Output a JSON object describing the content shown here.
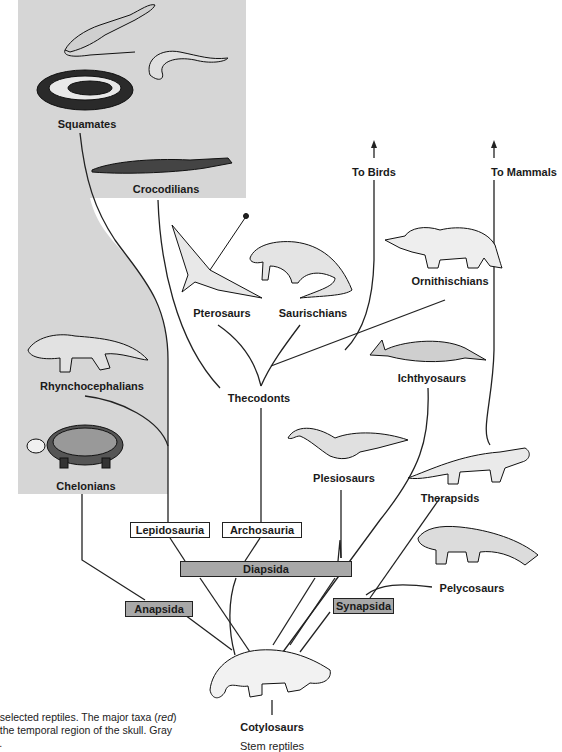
{
  "taxa": {
    "squamates": "Squamates",
    "crocodilians": "Crocodilians",
    "to_birds": "To Birds",
    "to_mammals": "To Mammals",
    "pterosaurs": "Pterosaurs",
    "saurischians": "Saurischians",
    "ornithischians": "Ornithischians",
    "rhynchocephalians": "Rhynchocephalians",
    "thecodonts": "Thecodonts",
    "ichthyosaurs": "Ichthyosaurs",
    "chelonians": "Chelonians",
    "plesiosaurs": "Plesiosaurs",
    "therapsids": "Therapsids",
    "pelycosaurs": "Pelycosaurs",
    "cotylosaurs": "Cotylosaurs",
    "stem_reptiles": "Stem reptiles"
  },
  "major_taxa_boxes": {
    "lepidosauria": "Lepidosauria",
    "archosauria": "Archosauria",
    "diapsida": "Diapsida",
    "anapsida": "Anapsida",
    "synapsida": "Synapsida"
  },
  "caption": {
    "line1_a": "f selected reptiles. The major taxa (",
    "line1_italic": "red",
    "line1_b": ")",
    "line2": "f the temporal region of the skull. Gray",
    "line3": "s."
  },
  "colors": {
    "shaded_region": "#d6d6d6",
    "gray_box": "#a8a8a8",
    "line": "#222222"
  }
}
